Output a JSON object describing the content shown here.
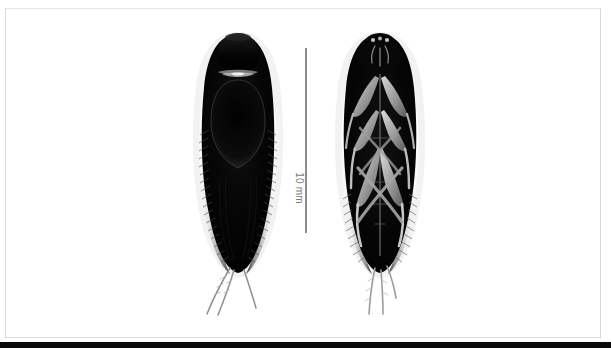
{
  "figure": {
    "background_color": "#ffffff",
    "frame_color": "#d9d9d9",
    "bottom_bar_color": "#0a0a0a",
    "body_color": "#050505",
    "body_midtone_color": "#3a3a3a",
    "membrane_color": "#c9c9c9",
    "seta_color": "#555555",
    "leg_color": "#9a9a9a"
  },
  "scale_bar": {
    "label": "10 mm",
    "orientation": "vertical",
    "text_rotation_deg": 90,
    "line_color": "#8c8c8c",
    "text_color": "#7a7a7a"
  },
  "specimens": [
    {
      "id": "dorsal",
      "view_label": "dorsal",
      "position": "left",
      "description": "whole-body dorsal habitus of a dark aquatic beetle with fringed lateral setae and two long terminal appendages"
    },
    {
      "id": "ventral",
      "view_label": "ventral",
      "position": "right",
      "description": "whole-body ventral habitus showing six legs radiating in an X pattern over the dark venter"
    }
  ]
}
